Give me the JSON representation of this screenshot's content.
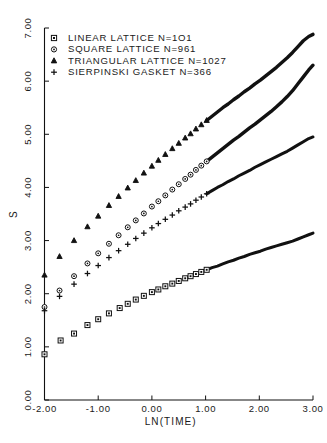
{
  "chart_data": {
    "type": "scatter",
    "title": "",
    "xlabel": "LN(TIME)",
    "ylabel": "S",
    "xlim": [
      -2.0,
      3.0
    ],
    "ylim": [
      0.0,
      7.0
    ],
    "grid": false,
    "legend_position": "top-left",
    "xticks": [
      "-2.00",
      "-1.00",
      "0.00",
      "1.00",
      "2.00",
      "3.00"
    ],
    "xtick_values": [
      -2,
      -1,
      0,
      1,
      2,
      3
    ],
    "yticks": [
      "0.00",
      "1.00",
      "2.00",
      "3.00",
      "4.00",
      "5.00",
      "6.00",
      "7.00"
    ],
    "ytick_values": [
      0,
      1,
      2,
      3,
      4,
      5,
      6,
      7
    ],
    "series": [
      {
        "name": "LINEAR LATTICE N=101",
        "marker": "square",
        "label": "LINEAR LATTICE N=1O1",
        "x": [
          -2.0,
          -1.7,
          -1.45,
          -1.2,
          -1.0,
          -0.8,
          -0.6,
          -0.45,
          -0.3,
          -0.15,
          0.0,
          0.12,
          0.25,
          0.38,
          0.5,
          0.62,
          0.72,
          0.82,
          0.92,
          1.02,
          1.12,
          1.22,
          1.32,
          1.42,
          1.52,
          1.62,
          1.72,
          1.82,
          1.92,
          2.02,
          2.12,
          2.22,
          2.32,
          2.42,
          2.52,
          2.62,
          2.72,
          2.82,
          2.92,
          3.0
        ],
        "y": [
          0.86,
          1.12,
          1.25,
          1.41,
          1.52,
          1.63,
          1.73,
          1.81,
          1.89,
          1.96,
          2.03,
          2.08,
          2.14,
          2.19,
          2.24,
          2.29,
          2.33,
          2.37,
          2.41,
          2.45,
          2.49,
          2.52,
          2.56,
          2.6,
          2.63,
          2.67,
          2.7,
          2.74,
          2.77,
          2.8,
          2.84,
          2.87,
          2.9,
          2.93,
          2.96,
          2.99,
          3.03,
          3.07,
          3.11,
          3.14
        ]
      },
      {
        "name": "SQUARE LATTICE N=961",
        "marker": "circle",
        "label": "SQUARE LATTICE N=961",
        "x": [
          -2.0,
          -1.72,
          -1.45,
          -1.2,
          -1.0,
          -0.8,
          -0.62,
          -0.45,
          -0.3,
          -0.15,
          0.0,
          0.12,
          0.25,
          0.38,
          0.5,
          0.62,
          0.72,
          0.82,
          0.92,
          1.02,
          1.12,
          1.22,
          1.32,
          1.42,
          1.52,
          1.62,
          1.72,
          1.82,
          1.92,
          2.02,
          2.12,
          2.22,
          2.32,
          2.42,
          2.52,
          2.62,
          2.72,
          2.82,
          2.92,
          3.0
        ],
        "y": [
          1.75,
          2.06,
          2.33,
          2.57,
          2.76,
          2.94,
          3.1,
          3.25,
          3.38,
          3.51,
          3.64,
          3.74,
          3.85,
          3.96,
          4.06,
          4.16,
          4.24,
          4.33,
          4.41,
          4.49,
          4.57,
          4.65,
          4.73,
          4.81,
          4.89,
          4.96,
          5.04,
          5.12,
          5.19,
          5.27,
          5.35,
          5.43,
          5.52,
          5.61,
          5.71,
          5.82,
          5.95,
          6.08,
          6.21,
          6.3
        ]
      },
      {
        "name": "TRIANGULAR LATTICE N=1027",
        "marker": "triangle",
        "label": "TRIANGULAR LATTICE N=1027",
        "x": [
          -2.0,
          -1.72,
          -1.45,
          -1.2,
          -1.0,
          -0.8,
          -0.62,
          -0.45,
          -0.3,
          -0.15,
          0.0,
          0.12,
          0.25,
          0.38,
          0.5,
          0.62,
          0.72,
          0.82,
          0.92,
          1.02,
          1.12,
          1.22,
          1.32,
          1.42,
          1.52,
          1.62,
          1.72,
          1.82,
          1.92,
          2.02,
          2.12,
          2.22,
          2.32,
          2.42,
          2.52,
          2.62,
          2.72,
          2.82,
          2.92,
          3.0
        ],
        "y": [
          2.35,
          2.7,
          3.0,
          3.26,
          3.46,
          3.66,
          3.83,
          3.99,
          4.13,
          4.27,
          4.4,
          4.51,
          4.62,
          4.73,
          4.83,
          4.93,
          5.01,
          5.1,
          5.18,
          5.26,
          5.34,
          5.42,
          5.5,
          5.57,
          5.65,
          5.72,
          5.8,
          5.87,
          5.95,
          6.02,
          6.1,
          6.18,
          6.26,
          6.35,
          6.44,
          6.54,
          6.65,
          6.76,
          6.84,
          6.88
        ]
      },
      {
        "name": "SIERPINSKI GASKET N=366",
        "marker": "plus",
        "label": "SIERPINSKI GASKET N=366",
        "x": [
          -2.0,
          -1.72,
          -1.45,
          -1.2,
          -1.0,
          -0.8,
          -0.62,
          -0.45,
          -0.3,
          -0.15,
          0.0,
          0.12,
          0.25,
          0.38,
          0.5,
          0.62,
          0.72,
          0.82,
          0.92,
          1.02,
          1.12,
          1.22,
          1.32,
          1.42,
          1.52,
          1.62,
          1.72,
          1.82,
          1.92,
          2.02,
          2.12,
          2.22,
          2.32,
          2.42,
          2.52,
          2.62,
          2.72,
          2.82,
          2.92,
          3.0
        ],
        "y": [
          1.68,
          1.95,
          2.18,
          2.38,
          2.53,
          2.68,
          2.81,
          2.93,
          3.04,
          3.14,
          3.24,
          3.32,
          3.4,
          3.48,
          3.56,
          3.63,
          3.69,
          3.76,
          3.82,
          3.88,
          3.94,
          4.0,
          4.05,
          4.11,
          4.16,
          4.22,
          4.27,
          4.32,
          4.38,
          4.43,
          4.48,
          4.53,
          4.58,
          4.63,
          4.68,
          4.74,
          4.8,
          4.86,
          4.92,
          4.95
        ]
      }
    ]
  },
  "legend": {
    "entries": [
      {
        "marker": "square",
        "label": "LINEAR LATTICE N=1O1"
      },
      {
        "marker": "circle",
        "label": "SQUARE LATTICE N=961"
      },
      {
        "marker": "triangle",
        "label": "TRIANGULAR LATTICE N=1027"
      },
      {
        "marker": "plus",
        "label": "SIERPINSKI GASKET N=366"
      }
    ]
  },
  "style": {
    "ink": "#111111",
    "background": "#ffffff"
  }
}
